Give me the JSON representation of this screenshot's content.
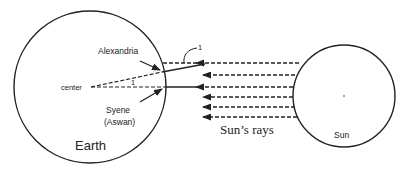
{
  "diagram": {
    "labels": {
      "alexandria": "Alexandria",
      "center": "center",
      "syene_line1": "Syene",
      "syene_line2": "(Aswan)",
      "earth": "Earth",
      "sun": "Sun",
      "sun_rays": "Sun’s rays",
      "angle_center": "1",
      "angle_alexandria": "1"
    },
    "bodies": [
      {
        "name": "Earth",
        "cx": 90,
        "cy": 87,
        "r": 76
      },
      {
        "name": "Sun",
        "cx": 344,
        "cy": 96,
        "r": 51
      }
    ],
    "rays_y": [
      63,
      75,
      87,
      97,
      107,
      117
    ],
    "colors": {
      "stroke": "#222222",
      "background": "#ffffff"
    }
  }
}
